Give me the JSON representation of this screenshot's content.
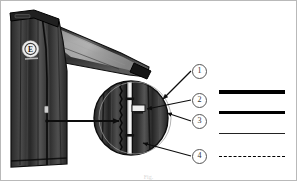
{
  "figure": {
    "caption": "Fig."
  },
  "garment": {
    "name": "jacket-illustration",
    "body_color": "#3a3a3a",
    "shade_dark": "#1e1e1e",
    "shade_light": "#7d7d7d",
    "highlight_color": "#b5b5b5",
    "outline_color": "#111111",
    "badge": {
      "name": "chest-logo-badge",
      "glyph": "E",
      "fill": "#efefef",
      "text_color": "#2a2a2a"
    }
  },
  "detail_view": {
    "name": "magnified-zipper-detail",
    "shape": "circle",
    "center_x": 130,
    "center_y": 117,
    "radius": 37,
    "zipper_tape_color": "#f2f2f2",
    "pointer_label": "detail arrow"
  },
  "callouts": [
    {
      "id": "1",
      "label": "1",
      "x": 192,
      "y": 64
    },
    {
      "id": "2",
      "label": "2",
      "x": 192,
      "y": 93
    },
    {
      "id": "3",
      "label": "3",
      "x": 192,
      "y": 114
    },
    {
      "id": "4",
      "label": "4",
      "x": 192,
      "y": 149
    }
  ],
  "legend": {
    "name": "line-style-legend",
    "items": [
      {
        "id": "1",
        "label": "1",
        "style": "solid",
        "thickness": 4,
        "color": "#000000",
        "y": 90
      },
      {
        "id": "2",
        "label": "2",
        "style": "solid",
        "thickness": 2.4,
        "color": "#000000",
        "y": 111
      },
      {
        "id": "3",
        "label": "3",
        "style": "solid",
        "thickness": 1,
        "color": "#222222",
        "y": 132
      },
      {
        "id": "4",
        "label": "4",
        "style": "dashed",
        "thickness": 1.6,
        "color": "#000000",
        "y": 155
      }
    ],
    "line_start_x": 218,
    "line_end_x": 284,
    "number_x": 286
  }
}
